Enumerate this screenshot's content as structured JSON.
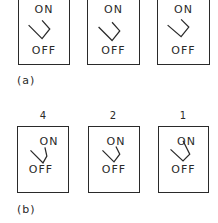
{
  "figure": {
    "panel_a": {
      "label": "(a)",
      "switches": [
        {
          "on_label": "ON",
          "off_label": "OFF",
          "state": "off"
        },
        {
          "on_label": "ON",
          "off_label": "OFF",
          "state": "off"
        },
        {
          "on_label": "ON",
          "off_label": "OFF",
          "state": "off"
        }
      ]
    },
    "panel_b": {
      "label": "(b)",
      "switches": [
        {
          "number": "4",
          "on_label": "ON",
          "off_label": "OFF",
          "state": "off"
        },
        {
          "number": "2",
          "on_label": "ON",
          "off_label": "OFF",
          "state": "off"
        },
        {
          "number": "1",
          "on_label": "ON",
          "off_label": "OFF",
          "state": "off"
        }
      ]
    },
    "line_color": "#2a2a2a"
  }
}
